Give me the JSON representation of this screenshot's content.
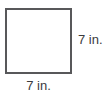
{
  "figure": {
    "name": "square-with-side-labels",
    "shape": "square",
    "unit": "in.",
    "stroke_color": "#58585a",
    "fill_color": "#ffffff",
    "text_color": "#3b3b3d",
    "background_color": "#ffffff",
    "labels": {
      "right_side": "7 in.",
      "bottom_side": "7 in."
    }
  },
  "chart_data": {
    "type": "diagram",
    "title": "",
    "shape": "square",
    "side_length": 7,
    "unit": "in.",
    "labeled_sides": [
      {
        "side": "right",
        "label": "7 in.",
        "value": 7
      },
      {
        "side": "bottom",
        "label": "7 in.",
        "value": 7
      }
    ]
  }
}
